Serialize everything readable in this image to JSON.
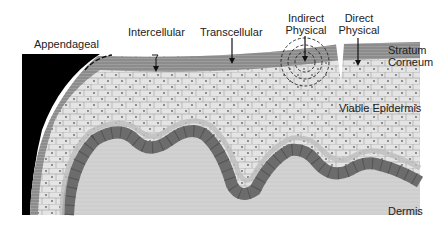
{
  "figure": {
    "labels": {
      "appendageal": "Appendageal",
      "intercellular": "Intercellular",
      "transcellular": "Transcellular",
      "indirect_physical_1": "Indirect",
      "indirect_physical_2": "Physical",
      "direct_physical_1": "Direct",
      "direct_physical_2": "Physical",
      "stratum_corneum_1": "Stratum",
      "stratum_corneum_2": "Corneum",
      "viable_epidermis": "Viable Epidermis",
      "dermis": "Dermis"
    },
    "colors": {
      "stratum_corneum": "#8a8a8a",
      "viable_epidermis": "#dcdcdc",
      "basal_cells": "#6e6e6e",
      "dermis": "#cfcfcf",
      "appendage": "#000000"
    }
  }
}
